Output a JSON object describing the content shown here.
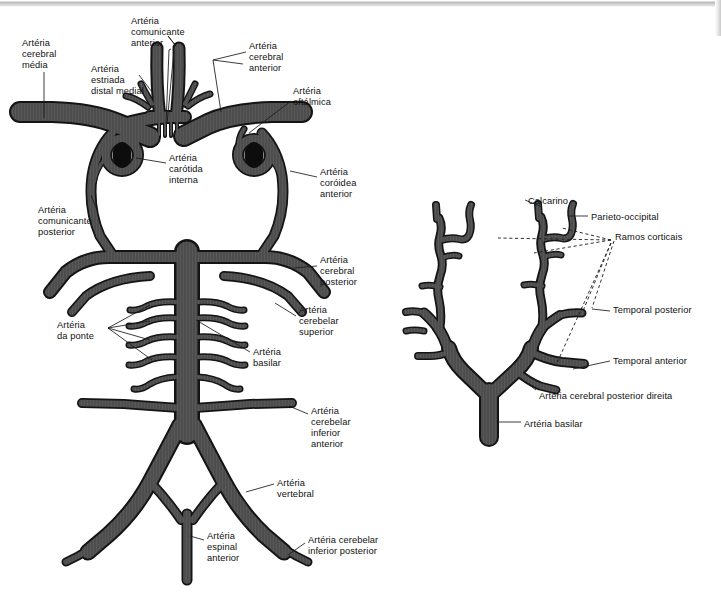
{
  "figure": {
    "vessel_color": "#4d4d4d",
    "vessel_outline": "#1a1a1a",
    "lumen_color": "#0d0d0d",
    "leader_color": "#1a1a1a",
    "background": "#ffffff",
    "caption": ""
  },
  "left_diagram": {
    "name": "poligono-de-willis",
    "labels": [
      {
        "id": "cerebral-media",
        "text": "Artéria\ncerebral\nmédia",
        "x": 22,
        "y": 38,
        "align": "left"
      },
      {
        "id": "comunicante-anterior",
        "text": "Artéria\ncomunicante\nanterior",
        "x": 131,
        "y": 16,
        "align": "left"
      },
      {
        "id": "cerebral-anterior",
        "text": "Artéria\ncerebral\nanterior",
        "x": 249,
        "y": 41,
        "align": "left"
      },
      {
        "id": "estriada-distal-medial",
        "text": "Artéria\nestriada\ndistal medial",
        "x": 91,
        "y": 64,
        "align": "left"
      },
      {
        "id": "oftalmica",
        "text": "Artéria\noftálmica",
        "x": 293,
        "y": 86,
        "align": "left"
      },
      {
        "id": "carotida-interna",
        "text": "Artéria\ncarótida\ninterna",
        "x": 169,
        "y": 153,
        "align": "left"
      },
      {
        "id": "coroidea-anterior",
        "text": "Artéria\ncoróidea\nanterior",
        "x": 320,
        "y": 167,
        "align": "left"
      },
      {
        "id": "comunicante-posterior",
        "text": "Artéria\ncomunicante\nposterior",
        "x": 38,
        "y": 205,
        "align": "left"
      },
      {
        "id": "cerebral-posterior",
        "text": "Artéria\ncerebral\nposterior",
        "x": 320,
        "y": 255,
        "align": "left"
      },
      {
        "id": "cerebelar-superior",
        "text": "Artéria\ncerebelar\nsuperior",
        "x": 299,
        "y": 305,
        "align": "left"
      },
      {
        "id": "da-ponte",
        "text": "Artéria\nda ponte",
        "x": 57,
        "y": 320,
        "align": "left"
      },
      {
        "id": "basilar",
        "text": "Artéria\nbasilar",
        "x": 253,
        "y": 347,
        "align": "left"
      },
      {
        "id": "cerebelar-inferior-anterior",
        "text": "Artéria\ncerebelar\ninferior\nanterior",
        "x": 311,
        "y": 406,
        "align": "left"
      },
      {
        "id": "vertebral",
        "text": "Artéria\nvertebral",
        "x": 277,
        "y": 478,
        "align": "left"
      },
      {
        "id": "espinal-anterior",
        "text": "Artéria\nespinal\nanterior",
        "x": 207,
        "y": 531,
        "align": "left"
      },
      {
        "id": "cerebelar-inferior-posterior",
        "text": "Artéria cerebelar\ninferior posterior",
        "x": 308,
        "y": 535,
        "align": "left"
      }
    ]
  },
  "right_diagram": {
    "name": "arteria-cerebral-posterior-direita",
    "labels": [
      {
        "id": "calcarino",
        "text": "Calcarino",
        "x": 528,
        "y": 196,
        "align": "left"
      },
      {
        "id": "parieto-occipital",
        "text": "Parieto-occipital",
        "x": 591,
        "y": 212,
        "align": "left"
      },
      {
        "id": "ramos-corticais",
        "text": "Ramos corticais",
        "x": 615,
        "y": 232,
        "align": "left"
      },
      {
        "id": "temporal-posterior",
        "text": "Temporal posterior",
        "x": 613,
        "y": 305,
        "align": "left"
      },
      {
        "id": "temporal-anterior",
        "text": "Temporal anterior",
        "x": 613,
        "y": 356,
        "align": "left"
      },
      {
        "id": "cerebral-posterior-direita",
        "text": "Artéria cerebral posterior direita",
        "x": 539,
        "y": 391,
        "align": "left"
      },
      {
        "id": "basilar-direita",
        "text": "Artéria basilar",
        "x": 524,
        "y": 419,
        "align": "left"
      }
    ]
  }
}
